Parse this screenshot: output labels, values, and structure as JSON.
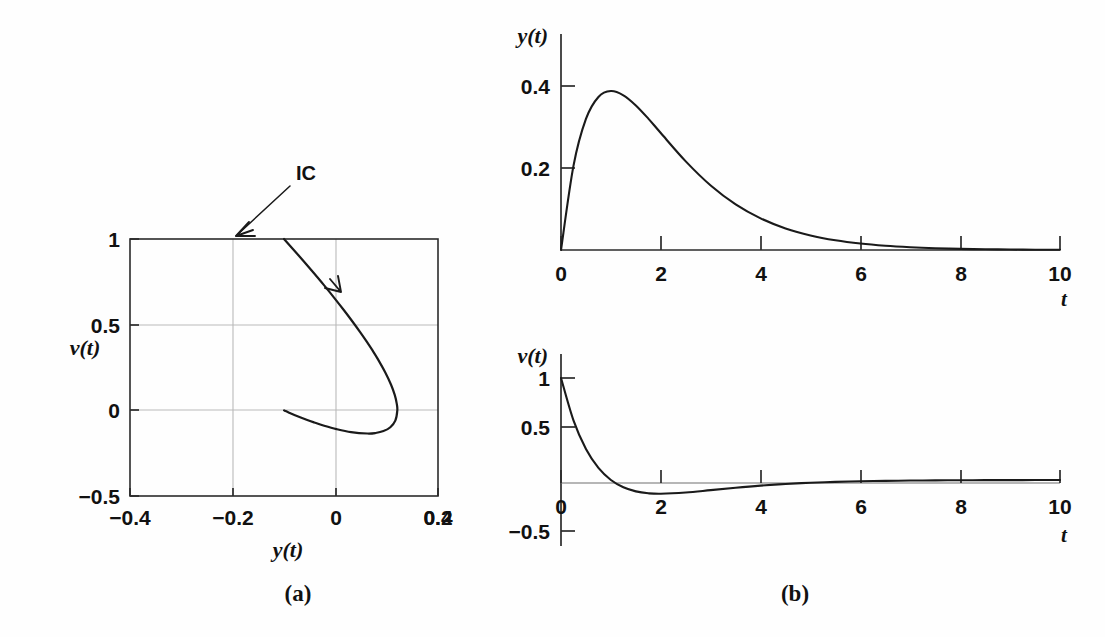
{
  "figure": {
    "background_color": "#fefefe",
    "ink_color": "#1a1a1a",
    "grid_color": "#b9b9b9"
  },
  "panel_a": {
    "caption": "(a)",
    "xlabel": "y(t)",
    "ylabel": "v(t)",
    "annotation": "IC",
    "x_ticks": [
      "−0.4",
      "−0.2",
      "0",
      "0.2",
      "0.4"
    ],
    "y_ticks": [
      "1",
      "0.5",
      "0",
      "−0.5"
    ]
  },
  "panel_b": {
    "caption": "(b)",
    "top": {
      "ylabel": "y(t)",
      "xlabel": "t",
      "y_ticks": [
        "0.4",
        "0.2"
      ],
      "x_ticks": [
        "0",
        "2",
        "4",
        "6",
        "8",
        "10"
      ]
    },
    "bottom": {
      "ylabel": "v(t)",
      "xlabel": "t",
      "y_ticks": [
        "1",
        "0.5",
        "0",
        "−0.5"
      ],
      "x_ticks": [
        "0",
        "2",
        "4",
        "6",
        "8",
        "10"
      ]
    }
  },
  "chart_data": [
    {
      "id": "phase-portrait",
      "type": "line",
      "title": "",
      "subfigure": "(a)",
      "xlabel": "y(t)",
      "ylabel": "v(t)",
      "xlim": [
        -0.5,
        0.5
      ],
      "ylim": [
        -0.5,
        1.0
      ],
      "xticks": [
        -0.4,
        -0.2,
        0,
        0.2,
        0.4
      ],
      "yticks": [
        -0.5,
        0,
        0.5,
        1
      ],
      "grid": true,
      "grid_lines_x": [
        -0.2,
        0,
        0.2
      ],
      "grid_lines_y": [
        0,
        0.5
      ],
      "parametric": "y(t) = t*exp(-t), v(t) = (1-t)*exp(-t)",
      "annotations": [
        {
          "text": "IC",
          "x": 0,
          "y": 1,
          "note": "initial condition at origin of trajectory"
        },
        {
          "text": "direction-arrow",
          "x": 0.13,
          "y": 0.63
        }
      ],
      "x": [
        0,
        0.0453,
        0.0819,
        0.1107,
        0.1329,
        0.1494,
        0.1611,
        0.1687,
        0.1728,
        0.1741,
        0.1729,
        0.1697,
        0.1648,
        0.1586,
        0.1512,
        0.1429,
        0.1341,
        0.1247,
        0.1151,
        0.1054,
        0.0957,
        0.0861,
        0.0767,
        0.0676,
        0.0589,
        0.0507,
        0.0429,
        0.0357,
        0.0291,
        0.023,
        0.0175,
        0.0126,
        0.0082,
        0.0043,
        0.0009,
        0.0
      ],
      "series": [
        {
          "name": "trajectory",
          "x_param_t": [
            0,
            0.05,
            0.1,
            0.15,
            0.2,
            0.25,
            0.3,
            0.35,
            0.4,
            0.45,
            0.5,
            0.6,
            0.7,
            0.8,
            0.9,
            1.0,
            1.2,
            1.4,
            1.6,
            1.8,
            2.0,
            2.4,
            2.8,
            3.2,
            3.6,
            4.0,
            5.0,
            6.0,
            8.0,
            10.0
          ],
          "y_values": [
            0,
            0.0476,
            0.0905,
            0.1291,
            0.1637,
            0.1947,
            0.2222,
            0.2466,
            0.2681,
            0.2869,
            0.3033,
            0.3293,
            0.3476,
            0.3595,
            0.3659,
            0.3679,
            0.3614,
            0.3452,
            0.323,
            0.2975,
            0.2707,
            0.2177,
            0.1703,
            0.1304,
            0.0984,
            0.0733,
            0.0337,
            0.0149,
            0.0027,
            0.00045
          ],
          "v_values": [
            1.0,
            0.9036,
            0.8145,
            0.7323,
            0.6552,
            0.5841,
            0.5185,
            0.4581,
            0.4024,
            0.3509,
            0.3033,
            0.2195,
            0.149,
            0.0899,
            0.0407,
            0.0,
            -0.0602,
            -0.0986,
            -0.1212,
            -0.1322,
            -0.1353,
            -0.1271,
            -0.1095,
            -0.0897,
            -0.071,
            -0.0549,
            -0.027,
            -0.0124,
            -0.0023,
            -0.00041
          ]
        }
      ]
    },
    {
      "id": "y-vs-t",
      "type": "line",
      "title": "",
      "subfigure": "(b) top",
      "xlabel": "t",
      "ylabel": "y(t)",
      "xlim": [
        0,
        10
      ],
      "ylim": [
        0,
        0.5
      ],
      "xticks": [
        0,
        2,
        4,
        6,
        8,
        10
      ],
      "yticks": [
        0.2,
        0.4
      ],
      "grid": false,
      "equation": "y(t) = t*exp(-t)",
      "peak": {
        "x": 1.0,
        "y": 0.3679
      },
      "x": [
        0,
        0.25,
        0.5,
        0.75,
        1.0,
        1.25,
        1.5,
        1.75,
        2.0,
        2.5,
        3.0,
        3.5,
        4.0,
        4.5,
        5.0,
        5.5,
        6.0,
        6.5,
        7.0,
        7.5,
        8.0,
        8.5,
        9.0,
        9.5,
        10.0
      ],
      "values": [
        0,
        0.1947,
        0.3033,
        0.3543,
        0.3679,
        0.3581,
        0.3347,
        0.3041,
        0.2707,
        0.2052,
        0.1494,
        0.1057,
        0.0733,
        0.05,
        0.0337,
        0.0225,
        0.0149,
        0.0098,
        0.0064,
        0.0041,
        0.0027,
        0.0017,
        0.0011,
        0.0007,
        0.00045
      ]
    },
    {
      "id": "v-vs-t",
      "type": "line",
      "title": "",
      "subfigure": "(b) bottom",
      "xlabel": "t",
      "ylabel": "v(t)",
      "xlim": [
        0,
        10
      ],
      "ylim": [
        -0.5,
        1.0
      ],
      "xticks": [
        0,
        2,
        4,
        6,
        8,
        10
      ],
      "yticks": [
        -0.5,
        0,
        0.5,
        1
      ],
      "grid": false,
      "equation": "v(t) = (1 - t)*exp(-t)",
      "zero_crossing": {
        "x": 1.0,
        "y": 0
      },
      "minimum": {
        "x": 2.0,
        "y": -0.1353
      },
      "x": [
        0,
        0.25,
        0.5,
        0.75,
        1.0,
        1.25,
        1.5,
        1.75,
        2.0,
        2.5,
        3.0,
        3.5,
        4.0,
        4.5,
        5.0,
        5.5,
        6.0,
        6.5,
        7.0,
        7.5,
        8.0,
        8.5,
        9.0,
        9.5,
        10.0
      ],
      "values": [
        1.0,
        0.5841,
        0.3033,
        0.1181,
        0.0,
        -0.0716,
        -0.1116,
        -0.1303,
        -0.1353,
        -0.1231,
        -0.0996,
        -0.0755,
        -0.0549,
        -0.0389,
        -0.027,
        -0.0184,
        -0.0124,
        -0.0083,
        -0.0055,
        -0.0036,
        -0.0023,
        -0.0015,
        -0.001,
        -0.0006,
        -0.00041
      ]
    }
  ]
}
